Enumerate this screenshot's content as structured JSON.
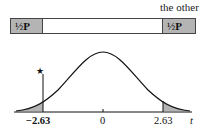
{
  "top_label": "the other",
  "bar": {
    "left_box": {
      "fraction": "½",
      "symbol": "P"
    },
    "right_box": {
      "fraction": "½",
      "symbol": "P"
    }
  },
  "axis": {
    "labels": [
      "−2.63",
      "0",
      "2.63"
    ],
    "variable": "t",
    "marker": "★"
  },
  "colors": {
    "shade": "#b4b4b4",
    "line": "#111111"
  }
}
